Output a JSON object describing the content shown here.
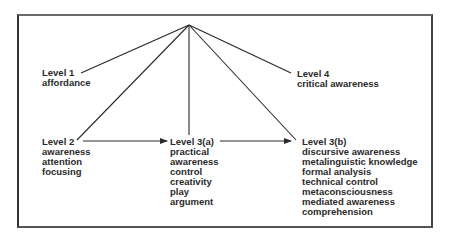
{
  "diagram": {
    "type": "hierarchy-of-awareness-levels",
    "nodes": {
      "level1": {
        "title": "Level 1",
        "items": [
          "affordance"
        ]
      },
      "level2": {
        "title": "Level 2",
        "items": [
          "awareness",
          "attention",
          "focusing"
        ]
      },
      "level3a": {
        "title": "Level 3(a)",
        "items": [
          "practical",
          "awareness",
          "control",
          "creativity",
          "play",
          "argument"
        ]
      },
      "level3b": {
        "title": "Level 3(b)",
        "items": [
          "discursive awareness",
          "metalinguistic knowledge",
          "formal analysis",
          "technical control",
          "metaconsciousness",
          "mediated awareness",
          "comprehension"
        ]
      },
      "level4": {
        "title": "Level 4",
        "items": [
          "critical awareness"
        ]
      }
    },
    "edges": [
      {
        "from": "apex",
        "to": "level1",
        "arrow": false
      },
      {
        "from": "apex",
        "to": "level2",
        "arrow": false
      },
      {
        "from": "apex",
        "to": "level3a",
        "arrow": false
      },
      {
        "from": "apex",
        "to": "level4",
        "arrow": false
      },
      {
        "from": "apex",
        "to": "level3b",
        "arrow": false
      },
      {
        "from": "level2",
        "to": "level3a",
        "arrow": true
      },
      {
        "from": "level3a",
        "to": "level3b",
        "arrow": true
      }
    ],
    "colors": {
      "line": "#2a2a2a",
      "text": "#2a2a2a",
      "frame": "#444444"
    }
  }
}
